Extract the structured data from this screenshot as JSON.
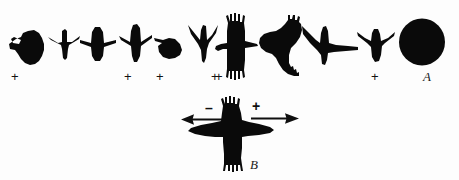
{
  "figure": {
    "background_color": "#fdfdfd",
    "ink_color": "#0a0a0a",
    "panels": [
      {
        "id": "A",
        "label": "A"
      },
      {
        "id": "B",
        "label": "B"
      }
    ]
  },
  "panel_a": {
    "label": "A",
    "caption_label": "A",
    "silhouette_count": 11,
    "marked_count": 6,
    "plus_symbol": "+",
    "silhouettes": [
      {
        "index": 1,
        "name": "silhouette-1-stocky-short-wings",
        "marked": true,
        "mark": "+"
      },
      {
        "index": 2,
        "name": "silhouette-2-slim-straight-wings",
        "marked": false,
        "mark": ""
      },
      {
        "index": 3,
        "name": "silhouette-3-broad-body-straight-wings",
        "marked": false,
        "mark": ""
      },
      {
        "index": 4,
        "name": "silhouette-4-slender-swept-wings",
        "marked": true,
        "mark": "+"
      },
      {
        "index": 5,
        "name": "silhouette-5-fan-tail-short-wings",
        "marked": true,
        "mark": "+"
      },
      {
        "index": 6,
        "name": "silhouette-6-crescent-swept-wings",
        "marked": true,
        "mark": "+"
      },
      {
        "index": 7,
        "name": "silhouette-7-buteo-fingered-wings",
        "marked": true,
        "mark": "+"
      },
      {
        "index": 8,
        "name": "silhouette-8-buteo-banked-fingered",
        "marked": false,
        "mark": ""
      },
      {
        "index": 9,
        "name": "silhouette-9-long-tailed-accipiter",
        "marked": false,
        "mark": ""
      },
      {
        "index": 10,
        "name": "silhouette-10-compact-pointed-wings",
        "marked": true,
        "mark": "+"
      },
      {
        "index": 11,
        "name": "silhouette-11-solid-disk",
        "marked": false,
        "mark": ""
      }
    ]
  },
  "panel_b": {
    "label": "B",
    "caption_label": "B",
    "silhouette_name": "silhouette-b-spread-wing-bird",
    "left_sign": "–",
    "right_sign": "+",
    "left_arrow_direction": "left",
    "right_arrow_direction": "right",
    "left_annotation": "minus-left-arrow",
    "right_annotation": "plus-right-arrow"
  }
}
